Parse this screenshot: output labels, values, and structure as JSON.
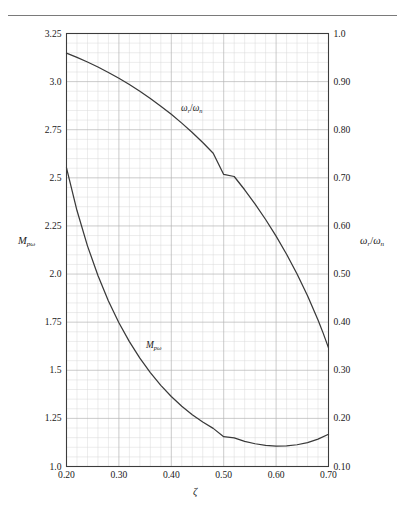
{
  "figure": {
    "background": "#ffffff",
    "rule_color": "#7a7a7a",
    "axis_color": "#3c3c3c",
    "grid_minor_color": "#d8d8d8",
    "grid_major_color": "#b4b4b4",
    "curve_color": "#3a3a3a"
  },
  "labels": {
    "x_axis_title": "ζ",
    "left_axis_title_base": "M",
    "left_axis_title_sub": "pω",
    "right_axis_title_num_base": "ω",
    "right_axis_title_num_sub": "r",
    "right_axis_title_slash": "/",
    "right_axis_title_den_base": "ω",
    "right_axis_title_den_sub": "n",
    "curve1_label_num_base": "ω",
    "curve1_label_num_sub": "r",
    "curve1_label_slash": "/",
    "curve1_label_den_base": "ω",
    "curve1_label_den_sub": "n",
    "curve2_label_base": "M",
    "curve2_label_sub": "pω"
  },
  "chart_data": {
    "type": "line",
    "title": "",
    "xlabel": "ζ",
    "ylabel": "M_pω",
    "y2label": "ω_r/ω_n",
    "grid": true,
    "legend": "inline-curve-labels",
    "xlim": [
      0.2,
      0.7
    ],
    "ylim": [
      1.0,
      3.25
    ],
    "y2lim": [
      0.1,
      1.0
    ],
    "xticks": [
      0.2,
      0.3,
      0.4,
      0.5,
      0.6,
      0.7
    ],
    "xtick_labels": [
      "0.20",
      "0.30",
      "0.40",
      "0.50",
      "0.60",
      "0.70"
    ],
    "yticks": [
      1.0,
      1.25,
      1.5,
      1.75,
      2.0,
      2.25,
      2.5,
      2.75,
      3.0,
      3.25
    ],
    "ytick_labels": [
      "1.0",
      "1.25",
      "1.5",
      "1.75",
      "2.0",
      "2.25",
      "2.5",
      "2.75",
      "3.0",
      "3.25"
    ],
    "y2ticks": [
      0.1,
      0.2,
      0.3,
      0.4,
      0.5,
      0.6,
      0.7,
      0.8,
      0.9,
      1.0
    ],
    "y2tick_labels": [
      "0.10",
      "0.20",
      "0.30",
      "0.40",
      "0.50",
      "0.60",
      "0.70",
      "0.80",
      "0.90",
      "1.0"
    ],
    "minor_divisions_per_major_x": 5,
    "minor_divisions_per_major_y": 5,
    "series": [
      {
        "name": "ω_r/ω_n",
        "axis": "right",
        "formula": "sqrt(1 - 2*zeta^2)",
        "x": [
          0.2,
          0.22,
          0.24,
          0.26,
          0.28,
          0.3,
          0.32,
          0.34,
          0.36,
          0.38,
          0.4,
          0.42,
          0.44,
          0.46,
          0.48,
          0.5,
          0.52,
          0.54,
          0.56,
          0.58,
          0.6,
          0.62,
          0.64,
          0.66,
          0.68,
          0.69,
          0.7,
          0.7071
        ],
        "values": [
          0.9592,
          0.9503,
          0.9407,
          0.9303,
          0.919,
          0.9069,
          0.8939,
          0.8799,
          0.865,
          0.849,
          0.832,
          0.8137,
          0.7942,
          0.7734,
          0.7511,
          0.7071,
          0.7028,
          0.6752,
          0.6455,
          0.6134,
          0.5788,
          0.5412,
          0.5002,
          0.455,
          0.4045,
          0.3767,
          0.3465,
          0.0
        ]
      },
      {
        "name": "M_pω",
        "axis": "left",
        "formula": "1/(2*zeta*sqrt(1 - zeta^2))",
        "x": [
          0.2,
          0.22,
          0.24,
          0.26,
          0.28,
          0.3,
          0.32,
          0.34,
          0.36,
          0.38,
          0.4,
          0.42,
          0.44,
          0.46,
          0.48,
          0.5,
          0.52,
          0.54,
          0.56,
          0.58,
          0.6,
          0.62,
          0.64,
          0.66,
          0.68,
          0.7,
          0.7071
        ],
        "values": [
          2.5516,
          2.33,
          2.1466,
          1.9922,
          1.8605,
          1.7471,
          1.6487,
          1.5628,
          1.4877,
          1.4218,
          1.3639,
          1.3133,
          1.2691,
          1.2308,
          1.1981,
          1.1547,
          1.1483,
          1.1309,
          1.1182,
          1.11,
          1.1063,
          1.1072,
          1.113,
          1.1243,
          1.1419,
          1.1673,
          1.0
        ]
      }
    ],
    "annotations": [
      {
        "text": "ω_r/ω_n",
        "x": 0.455,
        "y_right": 0.8
      },
      {
        "text": "M_pω",
        "x": 0.355,
        "y_left": 1.57
      }
    ]
  }
}
